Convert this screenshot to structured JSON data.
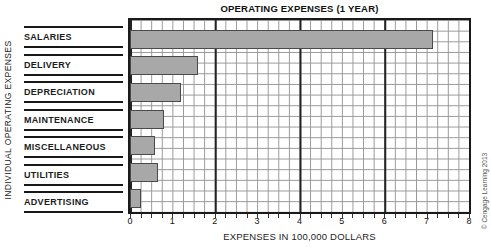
{
  "title": "OPERATING EXPENSES (1 YEAR)",
  "y_axis_label": "INDIVIDUAL OPERATING EXPENSES",
  "x_axis_label": "EXPENSES IN 100,000 DOLLARS",
  "copyright": "© Cengage Learning 2013",
  "colors": {
    "bar_fill": "#a8a8a8",
    "bar_border": "#4a4a4a",
    "grid_minor": "#989898",
    "grid_major": "#222222"
  },
  "chart_data": {
    "type": "bar",
    "orientation": "horizontal",
    "title": "OPERATING EXPENSES (1 YEAR)",
    "xlabel": "EXPENSES IN 100,000 DOLLARS",
    "ylabel": "INDIVIDUAL OPERATING EXPENSES",
    "categories": [
      "SALARIES",
      "DELIVERY",
      "DEPRECIATION",
      "MAINTENANCE",
      "MISCELLANEOUS",
      "UTILITIES",
      "ADVERTISING"
    ],
    "values": [
      7.15,
      1.6,
      1.2,
      0.8,
      0.6,
      0.65,
      0.25
    ],
    "xlim": [
      0,
      8
    ],
    "x_ticks": [
      0,
      1,
      2,
      3,
      4,
      5,
      6,
      7,
      8
    ],
    "grid": {
      "minor_step": 0.25,
      "major_step": 2,
      "shown": true
    },
    "legend": "none",
    "bar_color": "#a8a8a8"
  }
}
